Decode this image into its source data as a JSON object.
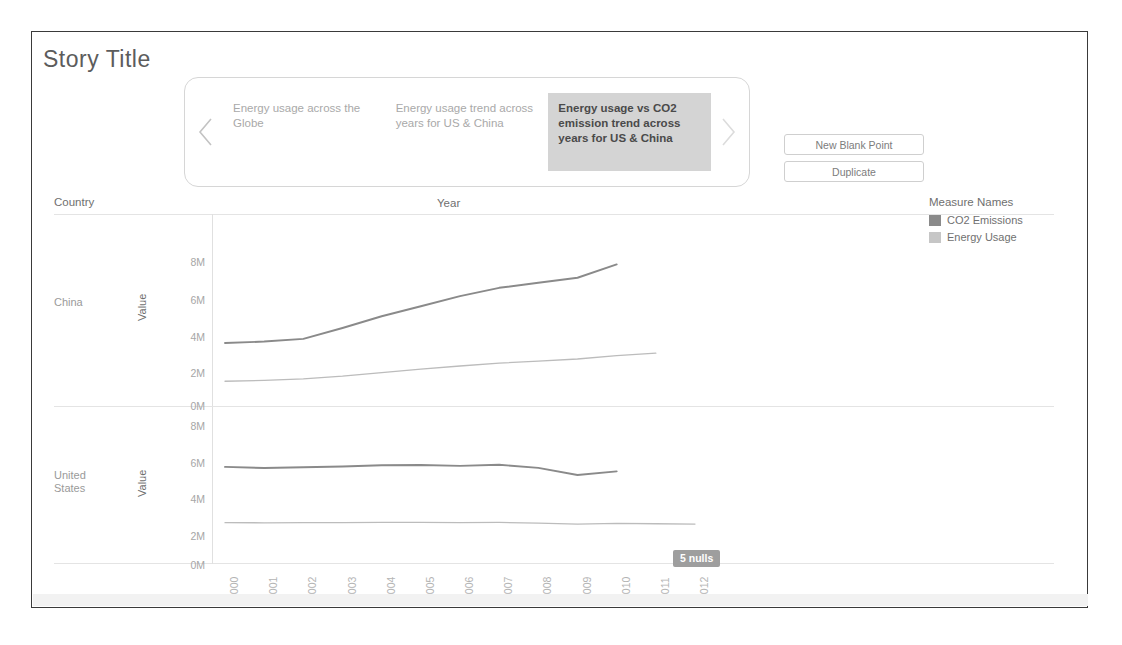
{
  "story": {
    "title": "Story Title",
    "navigator": {
      "prev_icon": "chevron-left-icon",
      "next_icon": "chevron-right-icon",
      "points": [
        {
          "label": "Energy usage across the Globe",
          "active": false
        },
        {
          "label": "Energy usage trend across years for US & China",
          "active": false
        },
        {
          "label": "Energy usage vs CO2 emission trend across years for US & China",
          "active": true
        }
      ]
    },
    "actions": [
      {
        "label": "New Blank Point"
      },
      {
        "label": "Duplicate"
      }
    ]
  },
  "legend": {
    "title": "Measure Names",
    "entries": [
      {
        "label": "CO2 Emissions",
        "color": "#8a8a8a"
      },
      {
        "label": "Energy Usage",
        "color": "#bcbcbc"
      }
    ]
  },
  "headers": {
    "country": "Country",
    "year": "Year",
    "value_axis": "Value"
  },
  "nulls_badge": "5 nulls",
  "chart_data": {
    "type": "line",
    "title": "Energy usage vs CO2 emission trend across years for US & China",
    "xlabel": "Year",
    "ylabel": "Value",
    "ylim": [
      0,
      8600000
    ],
    "yticks": [
      "0M",
      "2M",
      "4M",
      "6M",
      "8M"
    ],
    "ytick_values": [
      0,
      2000000,
      4000000,
      6000000,
      8000000
    ],
    "grid": false,
    "legend_position": "right",
    "x": [
      2000,
      2001,
      2002,
      2003,
      2004,
      2005,
      2006,
      2007,
      2008,
      2009,
      2010,
      2011,
      2012
    ],
    "panels": [
      {
        "country": "China",
        "series": [
          {
            "name": "CO2 Emissions",
            "color": "#8a8a8a",
            "x": [
              2000,
              2001,
              2002,
              2003,
              2004,
              2005,
              2006,
              2007,
              2008,
              2009,
              2010
            ],
            "values": [
              3405000,
              3490000,
              3650000,
              4300000,
              5000000,
              5600000,
              6200000,
              6700000,
              7000000,
              7300000,
              8100000
            ]
          },
          {
            "name": "Energy Usage",
            "color": "#bcbcbc",
            "x": [
              2000,
              2001,
              2002,
              2003,
              2004,
              2005,
              2006,
              2007,
              2008,
              2009,
              2010,
              2011
            ],
            "values": [
              1120000,
              1170000,
              1260000,
              1420000,
              1640000,
              1840000,
              2030000,
              2200000,
              2320000,
              2450000,
              2650000,
              2800000
            ]
          }
        ]
      },
      {
        "country": "United States",
        "series": [
          {
            "name": "CO2 Emissions",
            "color": "#8a8a8a",
            "x": [
              2000,
              2001,
              2002,
              2003,
              2004,
              2005,
              2006,
              2007,
              2008,
              2009,
              2010
            ],
            "values": [
              5700000,
              5630000,
              5680000,
              5720000,
              5800000,
              5820000,
              5760000,
              5830000,
              5640000,
              5200000,
              5420000
            ]
          },
          {
            "name": "Energy Usage",
            "color": "#bcbcbc",
            "x": [
              2000,
              2001,
              2002,
              2003,
              2004,
              2005,
              2006,
              2007,
              2008,
              2009,
              2010,
              2011,
              2012
            ],
            "values": [
              2250000,
              2240000,
              2250000,
              2250000,
              2260000,
              2260000,
              2250000,
              2260000,
              2220000,
              2160000,
              2200000,
              2180000,
              2160000
            ]
          }
        ]
      }
    ]
  }
}
